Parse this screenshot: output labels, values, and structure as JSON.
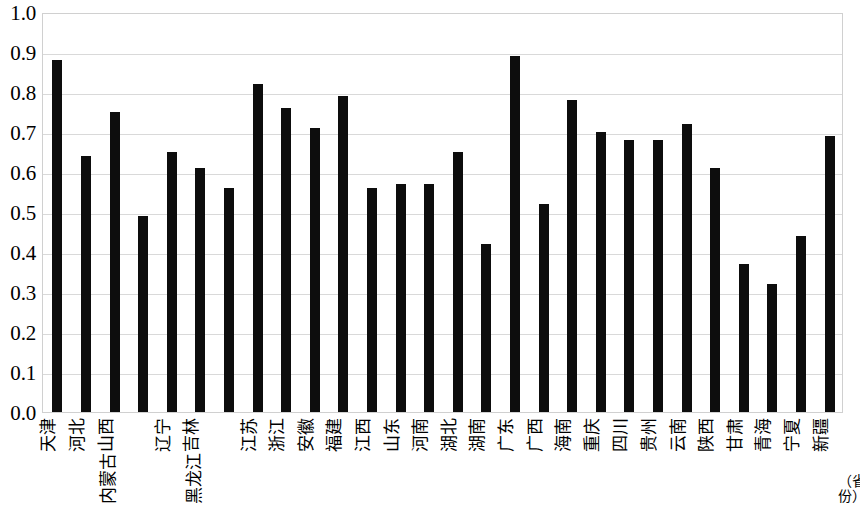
{
  "chart_data": {
    "type": "bar",
    "title": "",
    "subtitle": "",
    "xlabel": "（省份）",
    "ylabel": "",
    "ylim": [
      0.0,
      1.0
    ],
    "ytick_labels": [
      "1.0",
      "0.9",
      "0.8",
      "0.7",
      "0.6",
      "0.5",
      "0.4",
      "0.3",
      "0.2",
      "0.1",
      "0.0"
    ],
    "ytick_values": [
      1.0,
      0.9,
      0.8,
      0.7,
      0.6,
      0.5,
      0.4,
      0.3,
      0.2,
      0.1,
      0.0
    ],
    "grid": true,
    "legend": null,
    "legend_position": "none",
    "bar_color": "#0d0d0d",
    "grid_color": "#d9d9d9",
    "categories": [
      "天津",
      "河北",
      "山西",
      "内蒙古",
      "辽宁",
      "吉林",
      "黑龙江",
      "江苏",
      "浙江",
      "安徽",
      "福建",
      "江西",
      "山东",
      "河南",
      "湖北",
      "湖南",
      "广东",
      "广西",
      "海南",
      "重庆",
      "四川",
      "贵州",
      "云南",
      "陕西",
      "甘肃",
      "青海",
      "宁夏",
      "新疆"
    ],
    "values": [
      0.88,
      0.64,
      0.75,
      0.49,
      0.65,
      0.61,
      0.56,
      0.82,
      0.76,
      0.71,
      0.79,
      0.56,
      0.57,
      0.57,
      0.65,
      0.42,
      0.89,
      0.52,
      0.78,
      0.7,
      0.68,
      0.68,
      0.72,
      0.61,
      0.37,
      0.32,
      0.44,
      0.69
    ]
  }
}
